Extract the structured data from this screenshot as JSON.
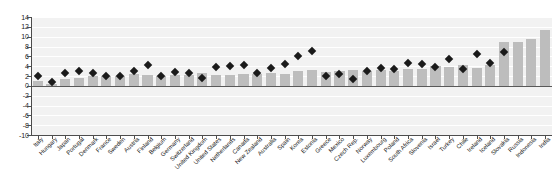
{
  "chart_data": {
    "type": "bar",
    "title": "",
    "subtitle": "",
    "xlabel": "",
    "ylabel": "",
    "ylim": [
      -10,
      14
    ],
    "ytick_step": 2,
    "yticks": [
      14,
      12,
      10,
      8,
      6,
      4,
      2,
      0,
      -2,
      -4,
      -6,
      -8,
      -10
    ],
    "ytick_labels": [
      "14",
      "12",
      "10",
      "8",
      "6",
      "4",
      "2",
      "0",
      "-2",
      "-4",
      "-6",
      "-8",
      "-10"
    ],
    "grid": true,
    "legend": "none",
    "bar_color": "#bdbdbd",
    "marker_color": "#1a1a1a",
    "marker_shape": "diamond",
    "plot_background": "#f2f2f2",
    "categories": [
      "Italy",
      "Hungary",
      "Japan",
      "Portugal",
      "Denmark",
      "France",
      "Sweden",
      "Austria",
      "Finland",
      "Belgium",
      "Germany",
      "Switzerland",
      "United Kingdom",
      "United States",
      "Netherlands",
      "Canada",
      "New Zealand",
      "Australia",
      "Spain",
      "Korea",
      "Estonia",
      "Greece",
      "Mexico",
      "Czech Rep.",
      "Norway",
      "Luxembourg",
      "Poland",
      "South Africa",
      "Slovenia",
      "Israel",
      "Turkey",
      "Chile",
      "Ireland",
      "Iceland",
      "Slovakia",
      "Russia",
      "Indonesia",
      "India"
    ],
    "series": [
      {
        "name": "bars",
        "type": "bar",
        "values": [
          1.0,
          0.4,
          1.3,
          1.6,
          2.0,
          1.9,
          1.9,
          2.4,
          2.3,
          2.1,
          2.2,
          2.2,
          2.6,
          2.3,
          2.2,
          2.5,
          2.4,
          2.6,
          2.5,
          3.0,
          3.2,
          2.8,
          3.1,
          3.2,
          3.0,
          3.2,
          3.1,
          3.4,
          3.5,
          4.1,
          3.8,
          4.2,
          3.6,
          4.3,
          9.0,
          9.0,
          9.6,
          11.3
        ]
      },
      {
        "name": "markers",
        "type": "scatter",
        "values": [
          1.9,
          0.7,
          2.6,
          3.1,
          2.7,
          2.1,
          1.9,
          3.0,
          4.2,
          2.1,
          2.9,
          2.6,
          1.6,
          3.8,
          4.0,
          4.2,
          2.7,
          3.6,
          4.5,
          6.0,
          7.0,
          2.0,
          2.5,
          1.4,
          3.1,
          3.7,
          3.4,
          4.7,
          4.4,
          3.9,
          5.4,
          3.5,
          6.5,
          4.6,
          6.8,
          null,
          null,
          null
        ]
      }
    ]
  }
}
